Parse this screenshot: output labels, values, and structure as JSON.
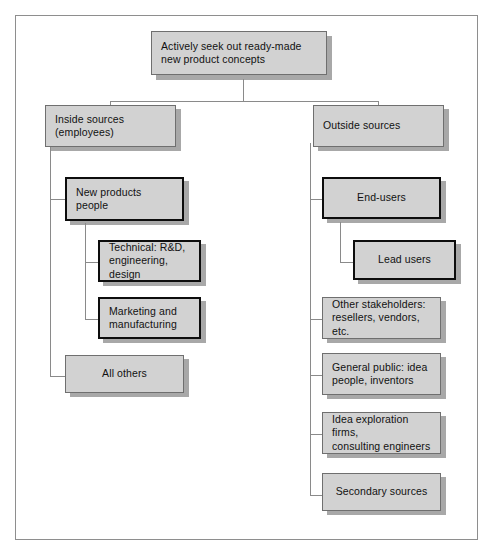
{
  "diagram": {
    "title_box": {
      "id": "root",
      "label": "Actively seek out ready-made\nnew  product concepts"
    },
    "branches": [
      {
        "id": "inside-sources",
        "label": "Inside sources\n(employees)",
        "children": [
          {
            "id": "new-products-people",
            "label": "New products\npeople",
            "emphasis": "thick",
            "children": [
              {
                "id": "technical-rd",
                "label": "Technical: R&D,\nengineering, design",
                "emphasis": "thick"
              },
              {
                "id": "marketing-manufacturing",
                "label": "Marketing and\nmanufacturing",
                "emphasis": "thick"
              }
            ]
          },
          {
            "id": "all-others",
            "label": "All others",
            "emphasis": "normal",
            "align": "center"
          }
        ]
      },
      {
        "id": "outside-sources",
        "label": "Outside sources",
        "children": [
          {
            "id": "end-users",
            "label": "End-users",
            "emphasis": "thick",
            "align": "center",
            "children": [
              {
                "id": "lead-users",
                "label": "Lead users",
                "emphasis": "thick",
                "align": "center"
              }
            ]
          },
          {
            "id": "other-stakeholders",
            "label": "Other stakeholders:\nresellers, vendors, etc.",
            "emphasis": "normal"
          },
          {
            "id": "general-public",
            "label": "General public: idea\npeople, inventors",
            "emphasis": "normal"
          },
          {
            "id": "idea-exploration-firms",
            "label": "Idea exploration firms,\nconsulting engineers",
            "emphasis": "normal"
          },
          {
            "id": "secondary-sources",
            "label": "Secondary sources",
            "emphasis": "normal",
            "align": "center"
          }
        ]
      }
    ]
  },
  "colors": {
    "box_fill": "#d2d2d2",
    "box_border": "#6f6f6f",
    "box_border_thick": "#0d0d0d",
    "shadow": "#a8a8a8",
    "connector": "#8a8a8a",
    "frame": "#8e8e8e",
    "text": "#111111",
    "background": "#ffffff"
  }
}
